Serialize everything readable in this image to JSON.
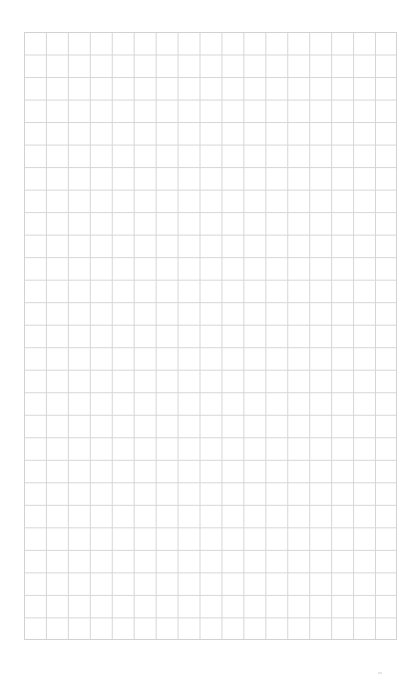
{
  "page": {
    "type": "graph-paper",
    "background_color": "#ffffff",
    "grid": {
      "columns": 17,
      "rows": 27,
      "line_color": "#d6d6d6",
      "left": 24,
      "top": 32,
      "width": 373,
      "height": 608
    },
    "footer": {
      "text": "",
      "page_mark": ""
    }
  }
}
